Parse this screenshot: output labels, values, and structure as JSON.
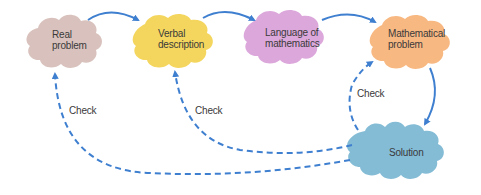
{
  "diagram": {
    "nodes": [
      {
        "id": "real",
        "label": "Real\nproblem",
        "color": "#d9c2bd"
      },
      {
        "id": "verbal",
        "label": "Verbal\ndescription",
        "color": "#f4d65e"
      },
      {
        "id": "language",
        "label": "Language of\nmathematics",
        "color": "#dca8dc"
      },
      {
        "id": "math",
        "label": "Mathematical\nproblem",
        "color": "#f8b882"
      },
      {
        "id": "solution",
        "label": "Solution",
        "color": "#84bcd6"
      }
    ],
    "edges": [
      {
        "from": "real",
        "to": "verbal",
        "style": "solid"
      },
      {
        "from": "verbal",
        "to": "language",
        "style": "solid"
      },
      {
        "from": "language",
        "to": "math",
        "style": "solid"
      },
      {
        "from": "math",
        "to": "solution",
        "style": "solid"
      },
      {
        "from": "solution",
        "to": "real",
        "style": "dashed",
        "label": "Check"
      },
      {
        "from": "solution",
        "to": "verbal",
        "style": "dashed",
        "label": "Check"
      },
      {
        "from": "solution",
        "to": "math",
        "style": "dashed",
        "label": "Check"
      }
    ],
    "arrow_color": "#3f7fd0"
  }
}
